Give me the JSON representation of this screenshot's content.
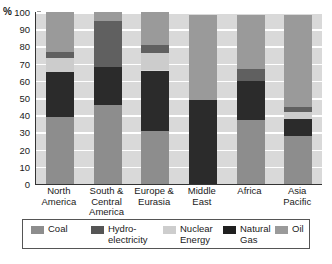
{
  "chart_data": {
    "type": "bar",
    "subtype": "stacked-100-percent",
    "title": "",
    "xlabel": "",
    "ylabel": "%",
    "ylim": [
      0,
      100
    ],
    "ytick_step": 10,
    "yticks": [
      100,
      90,
      80,
      70,
      60,
      50,
      40,
      30,
      20,
      10,
      0
    ],
    "grid": true,
    "grid_axis": "y",
    "legend_position": "bottom",
    "categories": [
      "North\nAmerica",
      "South &\nCentral\nAmerica",
      "Europe &\nEurasia",
      "Middle\nEast",
      "Africa",
      "Asia\nPacific"
    ],
    "series": [
      {
        "name": "Coal",
        "color": "#8d8d8d",
        "values": [
          39,
          46,
          31,
          0,
          37,
          28
        ]
      },
      {
        "name": "Natural Gas",
        "color": "#2b2b2b",
        "values": [
          26,
          22,
          35,
          49,
          23,
          10
        ]
      },
      {
        "name": "Nuclear Energy",
        "color": "#cccccc",
        "values": [
          8,
          0,
          10,
          0,
          0,
          4
        ]
      },
      {
        "name": "Hydro-electricity",
        "color": "#606060",
        "values": [
          4,
          27,
          5,
          0,
          7,
          3
        ]
      },
      {
        "name": "Oil",
        "color": "#9a9a9a",
        "values": [
          23,
          5,
          19,
          49,
          31,
          53
        ]
      }
    ],
    "bar_tops": [
      100,
      100,
      100,
      98,
      98,
      98
    ],
    "stack_order": [
      "Coal",
      "Natural Gas",
      "Nuclear Energy",
      "Hydro-electricity",
      "Oil"
    ]
  },
  "legend": {
    "items": [
      {
        "label": "Coal",
        "color": "#8d8d8d"
      },
      {
        "label": "Hydro-\nelectricity",
        "color": "#555555"
      },
      {
        "label": "Nuclear\nEnergy",
        "color": "#cdcdcd"
      },
      {
        "label": "Natural\nGas",
        "color": "#1f1f1f"
      },
      {
        "label": "Oil",
        "color": "#9a9a9a"
      }
    ]
  },
  "axis": {
    "unit_label": "%"
  }
}
